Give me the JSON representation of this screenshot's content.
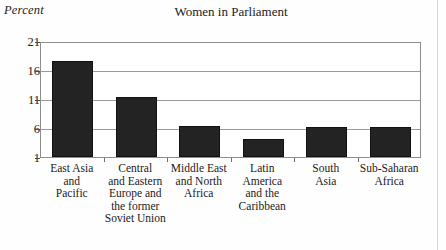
{
  "chart_data": {
    "type": "bar",
    "title": "Women in Parliament",
    "xlabel": "",
    "ylabel": "Percent",
    "ylim": [
      1,
      21
    ],
    "yticks": [
      21,
      16,
      11,
      6,
      1
    ],
    "grid": true,
    "legend": false,
    "bar_color": "#232323",
    "categories": [
      "East Asia and Pacific",
      "Central and Eastern Europe and the former Soviet Union",
      "Middle East and North Africa",
      "Latin America and the Caribbean",
      "South Asia",
      "Sub-Saharan Africa"
    ],
    "category_lines": [
      [
        "East Asia",
        "and",
        "Pacific"
      ],
      [
        "Central",
        "and Eastern",
        "Europe and",
        "the former",
        "Soviet Union"
      ],
      [
        "Middle East",
        "and North",
        "Africa"
      ],
      [
        "Latin",
        "America",
        "and the",
        "Caribbean"
      ],
      [
        "South",
        "Asia"
      ],
      [
        "Sub-Saharan",
        "Africa"
      ]
    ],
    "values": [
      17.6,
      11.3,
      6.4,
      4.1,
      6.2,
      6.2
    ]
  }
}
